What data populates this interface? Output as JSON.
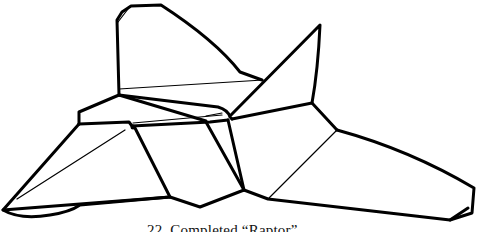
{
  "figure": {
    "caption": "22. Completed “Raptor”",
    "line_color": "#000000",
    "background": "#ffffff"
  }
}
